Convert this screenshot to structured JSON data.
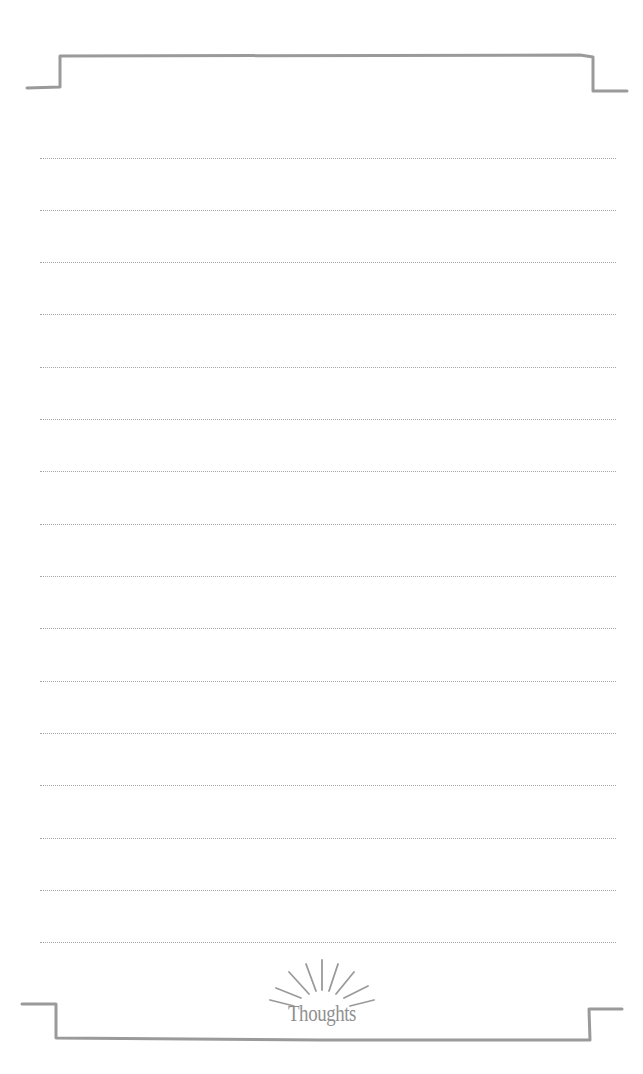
{
  "page": {
    "type": "lined-notepad",
    "background_color": "#ffffff",
    "frame_color": "#999999",
    "rule_color": "#a6a6a6",
    "rule_count": 16,
    "rule_style": "dotted"
  },
  "footer": {
    "label": "Thoughts",
    "icon": "sunburst-icon"
  }
}
